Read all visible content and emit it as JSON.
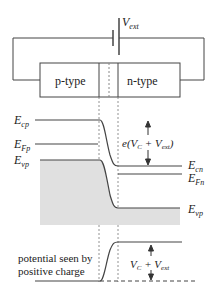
{
  "circuit": {
    "battery_label": "V",
    "battery_label_sub": "ext",
    "p_region_label": "p-type",
    "n_region_label": "n-type"
  },
  "bands": {
    "ecp": {
      "main": "E",
      "sub": "cp"
    },
    "efp": {
      "main": "E",
      "sub": "Fp"
    },
    "evp": {
      "main": "E",
      "sub": "vp"
    },
    "ecn": {
      "main": "E",
      "sub": "cn"
    },
    "efn": {
      "main": "E",
      "sub": "Fn"
    },
    "evn": {
      "main": "E",
      "sub": "vp"
    },
    "barrier_label": {
      "prefix": "e(",
      "v1": "V",
      "v1_sub": "C",
      "plus": " + ",
      "v2": "V",
      "v2_sub": "ext",
      "suffix": ")"
    }
  },
  "potential": {
    "caption_line1": "potential seen by",
    "caption_line2": "positive charge",
    "step_label": {
      "v1": "V",
      "v1_sub": "C",
      "plus": " + ",
      "v2": "V",
      "v2_sub": "ext"
    }
  },
  "colors": {
    "line": "#444444",
    "shade": "#e0e0e0",
    "text": "#222222"
  }
}
